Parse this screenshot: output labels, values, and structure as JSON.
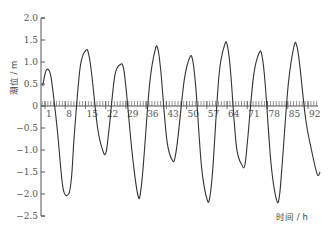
{
  "chart_data": {
    "type": "line",
    "title": "",
    "xlabel": "时间 / h",
    "ylabel": "潮位 / m",
    "ylim": [
      -2.5,
      2.0
    ],
    "xlim": [
      0,
      96
    ],
    "grid": false,
    "legend": null,
    "y_ticks": [
      "2.0",
      "1.5",
      "1.0",
      "0.5",
      "0",
      "-0.5",
      "-1.0",
      "-1.5",
      "-2.0",
      "-2.5"
    ],
    "x_ticks": [
      "1",
      "8",
      "15",
      "22",
      "29",
      "36",
      "43",
      "50",
      "57",
      "64",
      "71",
      "78",
      "85",
      "92"
    ],
    "series": [
      {
        "name": "潮位",
        "color": "#333333",
        "x": [
          0,
          1,
          2,
          3,
          5,
          7,
          9,
          10,
          11,
          13,
          15,
          16,
          17,
          19,
          21,
          22,
          23,
          25,
          27,
          28,
          29,
          31,
          33,
          34,
          35,
          37,
          39,
          40,
          41,
          43,
          45,
          46,
          47,
          49,
          51,
          52,
          53,
          55,
          57,
          58,
          59,
          61,
          63,
          64,
          65,
          67,
          69,
          70,
          71,
          73,
          75,
          76,
          77,
          79,
          81,
          82,
          83,
          85,
          87,
          88,
          89,
          91,
          93,
          95,
          96
        ],
        "values": [
          0.45,
          0.78,
          0.82,
          0.6,
          -0.5,
          -1.85,
          -2.0,
          -1.6,
          -0.6,
          0.9,
          1.27,
          1.15,
          0.7,
          -0.5,
          -1.05,
          -1.03,
          -0.5,
          0.7,
          0.95,
          0.85,
          0.3,
          -1.1,
          -2.05,
          -1.9,
          -1.2,
          0.5,
          1.3,
          1.25,
          0.7,
          -0.8,
          -1.25,
          -1.1,
          -0.6,
          0.6,
          1.12,
          1.0,
          0.4,
          -1.4,
          -2.15,
          -2.0,
          -1.3,
          0.7,
          1.4,
          1.35,
          0.8,
          -0.9,
          -1.35,
          -1.33,
          -0.7,
          0.7,
          1.22,
          1.1,
          0.5,
          -1.3,
          -2.15,
          -2.0,
          -1.2,
          0.5,
          1.37,
          1.35,
          0.9,
          -0.3,
          -1.0,
          -1.55,
          -1.5
        ]
      }
    ]
  }
}
